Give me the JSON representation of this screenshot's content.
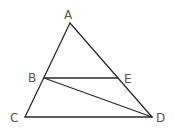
{
  "diagram": {
    "type": "geometry",
    "points": {
      "A": {
        "label": "A",
        "x": 70,
        "y": 23,
        "label_x": 64,
        "label_y": 19
      },
      "B": {
        "label": "B",
        "x": 44,
        "y": 78,
        "label_x": 28,
        "label_y": 82
      },
      "E": {
        "label": "E",
        "x": 118,
        "y": 78,
        "label_x": 124,
        "label_y": 83
      },
      "C": {
        "label": "C",
        "x": 25,
        "y": 117,
        "label_x": 10,
        "label_y": 122
      },
      "D": {
        "label": "D",
        "x": 152,
        "y": 117,
        "label_x": 156,
        "label_y": 122
      }
    },
    "segments": [
      {
        "name": "AC",
        "from": "A",
        "to": "C"
      },
      {
        "name": "AD",
        "from": "A",
        "to": "D"
      },
      {
        "name": "CD",
        "from": "C",
        "to": "D"
      },
      {
        "name": "BE",
        "from": "B",
        "to": "E"
      },
      {
        "name": "BD",
        "from": "B",
        "to": "D"
      }
    ],
    "colors": {
      "line": "#2a2a2a",
      "label": "#555555",
      "background": "#ffffff"
    }
  }
}
